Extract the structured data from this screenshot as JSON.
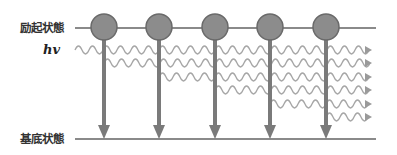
{
  "labels": {
    "excited_state": "励起状態",
    "ground_state": "基底状態",
    "photon": "hv"
  },
  "colors": {
    "level_line": "#8a8a8a",
    "atom_fill": "#8c8c8c",
    "atom_stroke": "#6a6a6a",
    "transition_arrow": "#7a7a7a",
    "wave": "#a6a6a6",
    "wave_arrowhead": "#9a9a9a"
  },
  "levels": {
    "excited_y": 28,
    "ground_y": 139,
    "x_start": 75,
    "x_end": 376
  },
  "atoms": [
    {
      "x": 104,
      "y": 27,
      "r": 13
    },
    {
      "x": 159,
      "y": 27,
      "r": 13
    },
    {
      "x": 215,
      "y": 27,
      "r": 13
    },
    {
      "x": 270,
      "y": 27,
      "r": 13
    },
    {
      "x": 326,
      "y": 27,
      "r": 13
    }
  ],
  "waves": [
    {
      "y": 50,
      "x_start": 75,
      "x_end": 372
    },
    {
      "y": 63,
      "x_start": 104,
      "x_end": 372
    },
    {
      "y": 77,
      "x_start": 159,
      "x_end": 372
    },
    {
      "y": 90,
      "x_start": 215,
      "x_end": 372
    },
    {
      "y": 104,
      "x_start": 270,
      "x_end": 372
    },
    {
      "y": 117,
      "x_start": 326,
      "x_end": 372
    }
  ]
}
